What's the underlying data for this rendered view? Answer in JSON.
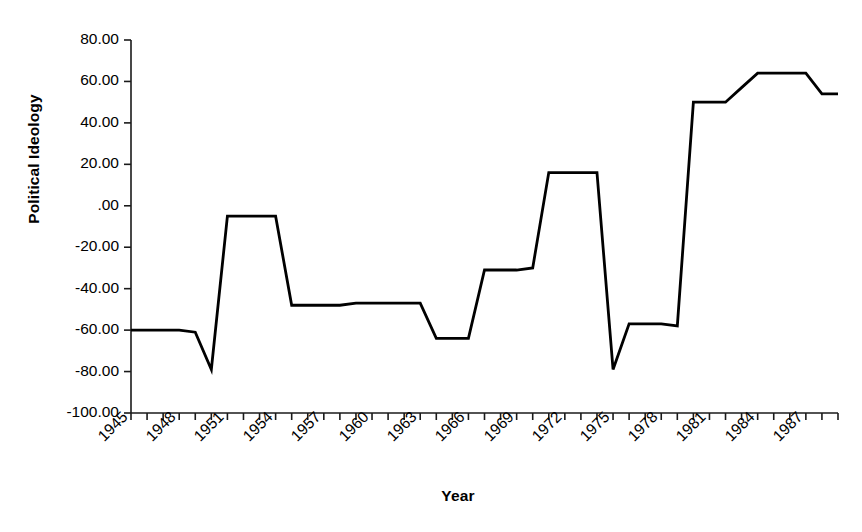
{
  "chart_data": {
    "type": "line",
    "title": "",
    "xlabel": "Year",
    "ylabel": "Political Ideology",
    "xlim": [
      1945,
      1989
    ],
    "ylim": [
      -100,
      80
    ],
    "grid": false,
    "legend": "none",
    "y_ticks": [
      "80.00",
      "60.00",
      "40.00",
      "20.00",
      ".00",
      "-20.00",
      "-40.00",
      "-60.00",
      "-80.00",
      "-100.00"
    ],
    "y_tick_values": [
      80,
      60,
      40,
      20,
      0,
      -20,
      -40,
      -60,
      -80,
      -100
    ],
    "x_tick_labels": [
      "1945",
      "1948",
      "1951",
      "1954",
      "1957",
      "1960",
      "1963",
      "1966",
      "1969",
      "1972",
      "1975",
      "1978",
      "1981",
      "1984",
      "1987"
    ],
    "x_tick_label_values": [
      1945,
      1948,
      1951,
      1954,
      1957,
      1960,
      1963,
      1966,
      1969,
      1972,
      1975,
      1978,
      1981,
      1984,
      1987
    ],
    "x_minor_tick_values": [
      1945,
      1946,
      1947,
      1948,
      1949,
      1950,
      1951,
      1952,
      1953,
      1954,
      1955,
      1956,
      1957,
      1958,
      1959,
      1960,
      1961,
      1962,
      1963,
      1964,
      1965,
      1966,
      1967,
      1968,
      1969,
      1970,
      1971,
      1972,
      1973,
      1974,
      1975,
      1976,
      1977,
      1978,
      1979,
      1980,
      1981,
      1982,
      1983,
      1984,
      1985,
      1986,
      1987,
      1988,
      1989
    ],
    "series": [
      {
        "name": "Political Ideology",
        "color": "#000000",
        "x": [
          1945,
          1946,
          1947,
          1948,
          1949,
          1950,
          1951,
          1952,
          1953,
          1954,
          1955,
          1956,
          1957,
          1958,
          1959,
          1960,
          1961,
          1962,
          1963,
          1964,
          1965,
          1966,
          1967,
          1968,
          1969,
          1970,
          1971,
          1972,
          1973,
          1974,
          1975,
          1976,
          1977,
          1978,
          1979,
          1980,
          1981,
          1982,
          1983,
          1984,
          1985,
          1986,
          1987,
          1988,
          1989
        ],
        "values": [
          -60,
          -60,
          -60,
          -60,
          -61,
          -79,
          -5,
          -5,
          -5,
          -5,
          -48,
          -48,
          -48,
          -48,
          -47,
          -47,
          -47,
          -47,
          -47,
          -64,
          -64,
          -64,
          -31,
          -31,
          -31,
          -30,
          16,
          16,
          16,
          16,
          -79,
          -57,
          -57,
          -57,
          -58,
          50,
          50,
          50,
          57,
          64,
          64,
          64,
          64,
          54,
          54
        ]
      }
    ]
  },
  "axis_style": {
    "line_color": "#1a1a1a",
    "line_width": 1.6,
    "series_width": 2.8
  }
}
